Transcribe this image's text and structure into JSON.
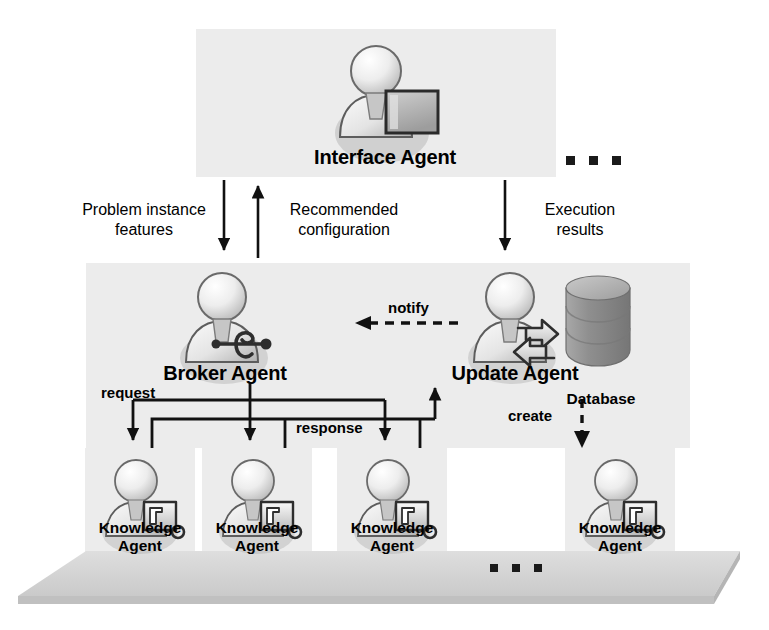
{
  "diagram": {
    "colors": {
      "panel": "#ececec",
      "stroke": "#111111",
      "icon_light": "#f2f2f2",
      "icon_mid": "#cfcfcf",
      "icon_dark": "#8e8e8e",
      "db_top": "#b9b9b9",
      "db_body": "#9a9a9a",
      "platform_top": "#d9d9d9",
      "platform_side": "#c4c4c4",
      "background": "#ffffff"
    },
    "agents": {
      "interface": {
        "label": "Interface Agent",
        "icon": "person-with-monitor-icon"
      },
      "broker": {
        "label": "Broker Agent",
        "icon": "person-with-network-icon"
      },
      "update": {
        "label": "Update Agent",
        "icon": "person-with-refresh-icon"
      },
      "knowledge": [
        {
          "label": "Knowledge\nAgent",
          "icon": "person-with-magnifier-icon"
        },
        {
          "label": "Knowledge\nAgent",
          "icon": "person-with-magnifier-icon"
        },
        {
          "label": "Knowledge\nAgent",
          "icon": "person-with-magnifier-icon"
        },
        {
          "label": "Knowledge\nAgent",
          "icon": "person-with-magnifier-icon"
        }
      ]
    },
    "database": {
      "label": "Database",
      "icon": "database-cylinder-icon"
    },
    "flows": {
      "problem_instance_features": "Problem instance\nfeatures",
      "recommended_configuration": "Recommended\nconfiguration",
      "execution_results": "Execution\nresults",
      "notify": "notify",
      "request": "request",
      "response": "response",
      "create": "create"
    },
    "ellipsis": {
      "top": "▪ ▪ ▪",
      "bottom": "▪ ▪ ▪"
    }
  }
}
